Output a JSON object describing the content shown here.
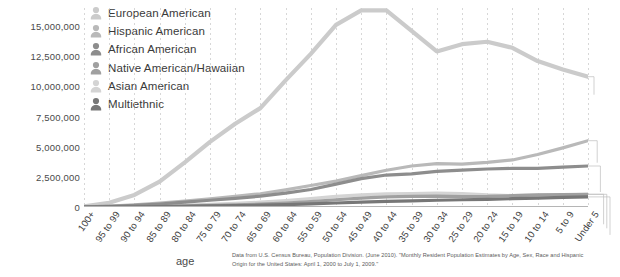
{
  "chart_data": {
    "type": "line",
    "title": "",
    "xlabel": "age",
    "ylabel": "",
    "ylim": [
      0,
      16500000
    ],
    "y_ticks": [
      0,
      2500000,
      5000000,
      7500000,
      10000000,
      12500000,
      15000000
    ],
    "y_tick_labels": [
      "0",
      "2,500,000",
      "5,000,000",
      "7,500,000",
      "10,000,000",
      "12,500,000",
      "15,000,000"
    ],
    "grid": "vertical-dotted",
    "legend_position": "top-left-inside",
    "x_axis_direction": "oldest-to-youngest",
    "categories": [
      "100+",
      "95 to 99",
      "90 to 94",
      "85 to 89",
      "80 to 84",
      "75 to 79",
      "70 to 74",
      "65 to 69",
      "60 to 64",
      "55 to 59",
      "50 to 54",
      "45 to 49",
      "40 to 44",
      "35 to 39",
      "30 to 34",
      "25 to 29",
      "20 to 24",
      "15 to 19",
      "10 to 14",
      "5 to 9",
      "Under 5"
    ],
    "series": [
      {
        "name": "European American",
        "color": "#cbcbcb",
        "icon": "person-icon",
        "values": [
          60000,
          350000,
          1000000,
          2100000,
          3700000,
          5400000,
          6900000,
          8200000,
          10500000,
          12700000,
          15100000,
          16300000,
          16300000,
          14600000,
          12900000,
          13500000,
          13700000,
          13200000,
          12100000,
          11400000,
          10800000
        ]
      },
      {
        "name": "Hispanic American",
        "color": "#b9b9b9",
        "icon": "person-icon",
        "values": [
          15000,
          70000,
          170000,
          320000,
          500000,
          680000,
          880000,
          1100000,
          1420000,
          1780000,
          2150000,
          2600000,
          3050000,
          3400000,
          3600000,
          3550000,
          3700000,
          3900000,
          4350000,
          4900000,
          5500000
        ]
      },
      {
        "name": "African American",
        "color": "#8d8d8d",
        "icon": "person-icon",
        "values": [
          12000,
          55000,
          130000,
          250000,
          400000,
          560000,
          720000,
          900000,
          1150000,
          1450000,
          1900000,
          2350000,
          2650000,
          2750000,
          2950000,
          3050000,
          3150000,
          3200000,
          3200000,
          3300000,
          3400000
        ]
      },
      {
        "name": "Native American/Hawaiian",
        "color": "#a0a0a0",
        "icon": "person-icon",
        "values": [
          3000,
          12000,
          30000,
          55000,
          90000,
          130000,
          180000,
          240000,
          330000,
          450000,
          600000,
          740000,
          840000,
          880000,
          900000,
          870000,
          880000,
          940000,
          1000000,
          1030000,
          1050000
        ]
      },
      {
        "name": "Asian American",
        "color": "#d4d4d4",
        "icon": "person-icon",
        "values": [
          4000,
          18000,
          45000,
          90000,
          150000,
          220000,
          300000,
          400000,
          540000,
          700000,
          880000,
          1000000,
          1080000,
          1120000,
          1150000,
          1120000,
          1000000,
          950000,
          980000,
          1000000,
          1050000
        ]
      },
      {
        "name": "Multiethnic",
        "color": "#777777",
        "icon": "person-icon",
        "values": [
          2000,
          8000,
          18000,
          35000,
          58000,
          85000,
          115000,
          150000,
          200000,
          260000,
          330000,
          400000,
          460000,
          510000,
          560000,
          600000,
          640000,
          690000,
          740000,
          790000,
          840000
        ]
      }
    ]
  },
  "legend": {
    "items": [
      {
        "label": "European American"
      },
      {
        "label": "Hispanic American"
      },
      {
        "label": "African American"
      },
      {
        "label": "Native American/Hawaiian"
      },
      {
        "label": "Asian American"
      },
      {
        "label": "Multiethnic"
      }
    ]
  },
  "axis": {
    "x_title": "age"
  },
  "source": {
    "text": "Data from U.S. Census Bureau, Population Division. (June 2010). \"Monthly Resident Population Estimates by Age, Sex, Race and Hispanic Origin for the United States: April 1, 2000 to July 1, 2009.\""
  },
  "colors": {
    "background": "#ffffff",
    "text": "#3d3d3d",
    "grid": "#c9c9c9",
    "baseline": "#b5b5b5"
  }
}
